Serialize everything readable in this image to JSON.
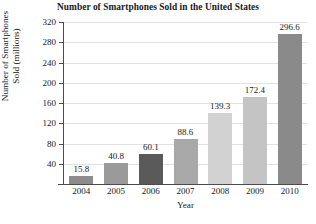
{
  "chart_data": {
    "type": "bar",
    "title": "Number of Smartphones Sold in the United States",
    "xlabel": "Year",
    "ylabel_line1": "Number of Smartphones",
    "ylabel_line2": "Sold (millions)",
    "categories": [
      "2004",
      "2005",
      "2006",
      "2007",
      "2008",
      "2009",
      "2010"
    ],
    "values": [
      15.8,
      40.8,
      60.1,
      88.6,
      139.3,
      172.4,
      296.6
    ],
    "value_labels": [
      "15.8",
      "40.8",
      "60.1",
      "88.6",
      "139.3",
      "172.4",
      "296.6"
    ],
    "bar_colors": [
      "#8c8c8c",
      "#9a9a9a",
      "#5a5a5a",
      "#a8a8a8",
      "#d2d2d2",
      "#c4c4c4",
      "#8a8a8a"
    ],
    "ylim": [
      0,
      320
    ],
    "yticks": [
      40,
      80,
      120,
      160,
      200,
      240,
      280,
      320
    ],
    "ytick_labels": [
      "40",
      "80",
      "120",
      "160",
      "200",
      "240",
      "280",
      "320"
    ],
    "grid": true,
    "legend": "none",
    "axis_color": "#4b4b4b",
    "grid_color": "#e2e2e2"
  }
}
